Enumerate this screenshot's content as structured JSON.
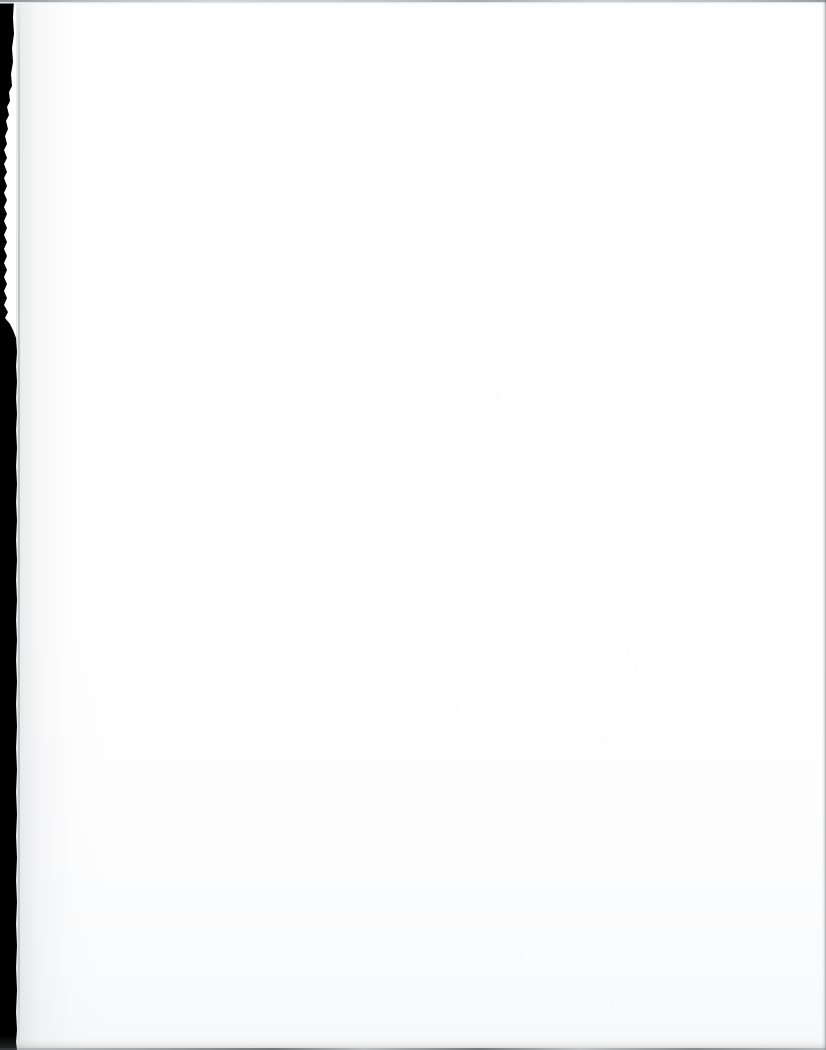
{
  "document": {
    "kind": "scanned-page",
    "page_content_text": "",
    "page_state_label": "blank",
    "width_px": 826,
    "height_px": 1050
  },
  "colors": {
    "paper": "#ffffff",
    "paper_shadow": "#f7f8f9",
    "binding_margin": "#000000",
    "gutter_crease": "#767a7e",
    "top_strip": "#d9dcde",
    "top_strip_dark": "#8d9093",
    "right_edge": "#5a5e62",
    "bottom_band": "#787c80",
    "bottom_rule": "#5f6367"
  },
  "regions": {
    "binding_margin_label": "binding-margin",
    "gutter_label": "gutter-crease",
    "top_strip_label": "top-scan-strip",
    "right_edge_label": "right-edge-line",
    "bottom_band_label": "bottom-shadow-band",
    "paper_label": "paper-surface"
  },
  "binding_margin_outline": "M 0,0 L 14,0 L 13,18 L 14,34 L 12,48 L 13,62 L 11,74 L 12,86 L 9,92 L 10,101 L 7,107 L 9,115 L 6,121 L 8,129 L 5,136 L 7,144 L 4,150 L 7,158 L 4,164 L 7,172 L 4,178 L 7,186 L 4,193 L 7,200 L 4,207 L 7,214 L 4,221 L 7,228 L 4,235 L 7,242 L 4,249 L 7,256 L 4,263 L 7,270 L 4,277 L 7,284 L 4,291 L 7,298 L 4,305 L 8,312 L 5,318 L 10,324 L 13,330 L 16,338 L 17,352 L 16,366 L 17,382 L 16,398 L 17,414 L 16,430 L 17,448 L 16,466 L 17,484 L 16,502 L 17,520 L 16,540 L 17,560 L 16,580 L 17,600 L 16,620 L 17,640 L 16,660 L 17,682 L 16,704 L 17,726 L 16,748 L 17,770 L 16,792 L 17,814 L 16,836 L 17,858 L 16,880 L 17,902 L 16,924 L 17,946 L 16,968 L 17,990 L 16,1012 L 17,1030 L 16,1042 L 17,1050 L 0,1050 Z",
  "speckles": [
    {
      "x": 172,
      "y": 318,
      "w": 3,
      "h": 4,
      "a": 0.05
    },
    {
      "x": 508,
      "y": 338,
      "w": 4,
      "h": 3,
      "a": 0.04
    },
    {
      "x": 497,
      "y": 394,
      "w": 3,
      "h": 5,
      "a": 0.045
    },
    {
      "x": 405,
      "y": 435,
      "w": 4,
      "h": 4,
      "a": 0.035
    },
    {
      "x": 628,
      "y": 402,
      "w": 3,
      "h": 3,
      "a": 0.04
    },
    {
      "x": 629,
      "y": 420,
      "w": 3,
      "h": 3,
      "a": 0.035
    },
    {
      "x": 650,
      "y": 414,
      "w": 2,
      "h": 4,
      "a": 0.05
    },
    {
      "x": 716,
      "y": 538,
      "w": 3,
      "h": 3,
      "a": 0.04
    },
    {
      "x": 627,
      "y": 517,
      "w": 3,
      "h": 3,
      "a": 0.035
    },
    {
      "x": 773,
      "y": 527,
      "w": 3,
      "h": 3,
      "a": 0.035
    },
    {
      "x": 713,
      "y": 533,
      "w": 3,
      "h": 3,
      "a": 0.04
    },
    {
      "x": 627,
      "y": 652,
      "w": 3,
      "h": 3,
      "a": 0.035
    },
    {
      "x": 634,
      "y": 668,
      "w": 3,
      "h": 3,
      "a": 0.035
    },
    {
      "x": 658,
      "y": 678,
      "w": 3,
      "h": 3,
      "a": 0.04
    },
    {
      "x": 637,
      "y": 692,
      "w": 3,
      "h": 3,
      "a": 0.035
    },
    {
      "x": 455,
      "y": 706,
      "w": 5,
      "h": 3,
      "a": 0.03
    },
    {
      "x": 600,
      "y": 737,
      "w": 3,
      "h": 3,
      "a": 0.03
    },
    {
      "x": 478,
      "y": 785,
      "w": 3,
      "h": 3,
      "a": 0.035
    },
    {
      "x": 255,
      "y": 60,
      "w": 6,
      "h": 3,
      "a": 0.03
    },
    {
      "x": 322,
      "y": 45,
      "w": 5,
      "h": 3,
      "a": 0.03
    },
    {
      "x": 618,
      "y": 52,
      "w": 5,
      "h": 3,
      "a": 0.03
    },
    {
      "x": 760,
      "y": 48,
      "w": 5,
      "h": 3,
      "a": 0.03
    },
    {
      "x": 200,
      "y": 155,
      "w": 5,
      "h": 3,
      "a": 0.025
    },
    {
      "x": 360,
      "y": 120,
      "w": 5,
      "h": 3,
      "a": 0.025
    },
    {
      "x": 95,
      "y": 245,
      "w": 4,
      "h": 3,
      "a": 0.03
    },
    {
      "x": 289,
      "y": 452,
      "w": 4,
      "h": 3,
      "a": 0.025
    },
    {
      "x": 150,
      "y": 905,
      "w": 5,
      "h": 3,
      "a": 0.03
    },
    {
      "x": 330,
      "y": 930,
      "w": 5,
      "h": 3,
      "a": 0.03
    },
    {
      "x": 520,
      "y": 955,
      "w": 5,
      "h": 3,
      "a": 0.03
    },
    {
      "x": 700,
      "y": 925,
      "w": 5,
      "h": 3,
      "a": 0.03
    },
    {
      "x": 260,
      "y": 990,
      "w": 5,
      "h": 3,
      "a": 0.03
    },
    {
      "x": 610,
      "y": 1000,
      "w": 5,
      "h": 3,
      "a": 0.03
    }
  ]
}
